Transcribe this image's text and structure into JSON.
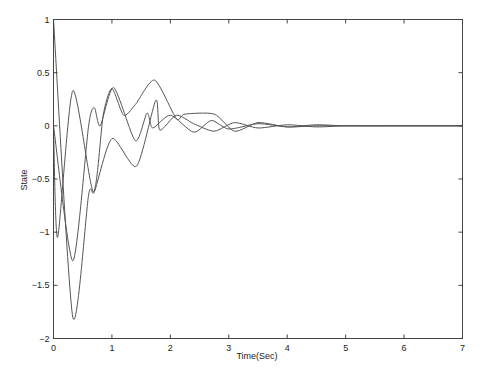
{
  "chart_data": {
    "type": "line",
    "title": "",
    "xlabel": "Time(Sec)",
    "ylabel": "State",
    "xlim": [
      0,
      7
    ],
    "ylim": [
      -2,
      1
    ],
    "grid": false,
    "legend": null,
    "xticks": [
      0,
      1,
      2,
      3,
      4,
      5,
      6,
      7
    ],
    "xtick_labels": [
      "0",
      "1",
      "2",
      "3",
      "4",
      "5",
      "6",
      "7"
    ],
    "yticks": [
      1,
      0.5,
      0,
      -0.5,
      -1,
      -1.5,
      -2
    ],
    "ytick_labels": [
      "1",
      "0.5",
      "0",
      "-0.5",
      "-1",
      "-1.5",
      "-2"
    ],
    "line_color": "#555555",
    "series": [
      {
        "name": "state-1",
        "x": [
          0,
          0.33,
          0.6,
          0.7,
          1.0,
          1.42,
          1.75,
          1.82,
          2.1,
          2.4,
          2.75,
          3.1,
          3.5,
          4.0,
          4.5,
          5.0,
          5.5,
          6.0,
          7.0
        ],
        "y": [
          1,
          -1.8,
          -0.65,
          -0.62,
          -0.12,
          -0.38,
          0.24,
          -0.04,
          0.1,
          0.02,
          -0.05,
          0.03,
          -0.02,
          0.01,
          -0.01,
          0.0,
          0.0,
          0.0,
          0.0
        ]
      },
      {
        "name": "state-2",
        "x": [
          0,
          0.07,
          0.33,
          0.68,
          0.85,
          1.0,
          1.2,
          1.4,
          1.73,
          2.1,
          2.25,
          2.75,
          3.1,
          3.5,
          4.0,
          4.5,
          5.0,
          6.0,
          7.0
        ],
        "y": [
          0,
          -1.05,
          0.33,
          -0.62,
          0.1,
          0.35,
          0.1,
          0.2,
          0.43,
          0.07,
          0.11,
          0.11,
          -0.05,
          0.03,
          -0.01,
          0.01,
          0.0,
          0.0,
          0.0
        ]
      },
      {
        "name": "state-3",
        "x": [
          0,
          0.33,
          0.6,
          0.7,
          0.8,
          1.03,
          1.4,
          1.6,
          1.7,
          2.0,
          2.4,
          2.7,
          3.0,
          3.5,
          4.0,
          4.5,
          5.0,
          6.0,
          7.0
        ],
        "y": [
          0,
          -1.27,
          0.0,
          0.17,
          0.0,
          0.36,
          -0.14,
          0.12,
          -0.02,
          0.1,
          -0.06,
          0.05,
          -0.03,
          0.02,
          -0.01,
          0.0,
          0.0,
          0.0,
          0.0
        ]
      }
    ]
  }
}
